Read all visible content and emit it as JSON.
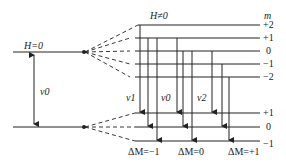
{
  "diagram": {
    "field_off_label": "H=0",
    "field_on_label": "H≠0",
    "m_header": "m",
    "upper_levels": [
      "+2",
      "+1",
      "0",
      "−1",
      "−2"
    ],
    "lower_levels": [
      "+1",
      "0",
      "−1"
    ],
    "nu0_left": "ν0",
    "transition_labels": {
      "nu1": "ν1",
      "nu0": "ν0",
      "nu2": "ν2"
    },
    "delta_m_labels": [
      "ΔM=−1",
      "ΔM=0",
      "ΔM=+1"
    ],
    "colors": {
      "line": "#222222",
      "background": "#ffffff"
    }
  }
}
